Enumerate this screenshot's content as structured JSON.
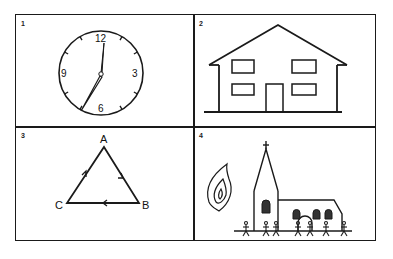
{
  "panels": [
    {
      "number": "1",
      "subject": "clock",
      "clock": {
        "numerals": [
          "12",
          "3",
          "6",
          "9"
        ],
        "time_shown": "6:58"
      }
    },
    {
      "number": "2",
      "subject": "house"
    },
    {
      "number": "3",
      "subject": "triangle-cycle",
      "vertices": [
        "A",
        "B",
        "C"
      ]
    },
    {
      "number": "4",
      "subject": "church-with-flame-and-people"
    }
  ],
  "colors": {
    "ink": "#1a1a1a",
    "background": "#ffffff"
  }
}
